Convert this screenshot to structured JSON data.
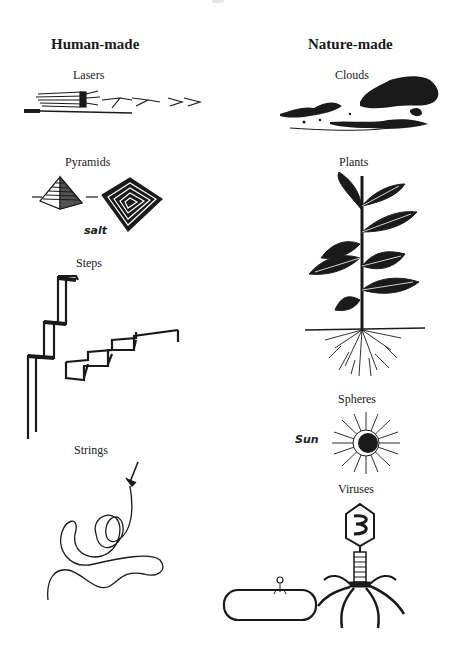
{
  "columns": [
    {
      "heading": "Human-made",
      "items": [
        {
          "label": "Lasers",
          "figure": "laser-icon"
        },
        {
          "label": "Pyramids",
          "figure": "pyramid-icon",
          "annotation": "salt"
        },
        {
          "label": "Steps",
          "figure": "steps-icon"
        },
        {
          "label": "Strings",
          "figure": "string-icon"
        }
      ]
    },
    {
      "heading": "Nature-made",
      "items": [
        {
          "label": "Clouds",
          "figure": "clouds-icon"
        },
        {
          "label": "Plants",
          "figure": "plant-icon"
        },
        {
          "label": "Spheres",
          "figure": "sun-icon",
          "annotation": "Sun"
        },
        {
          "label": "Viruses",
          "figure": "bacteriophage-icon"
        }
      ]
    }
  ],
  "colors": {
    "ink": "#1a1a1a",
    "background": "#ffffff"
  }
}
